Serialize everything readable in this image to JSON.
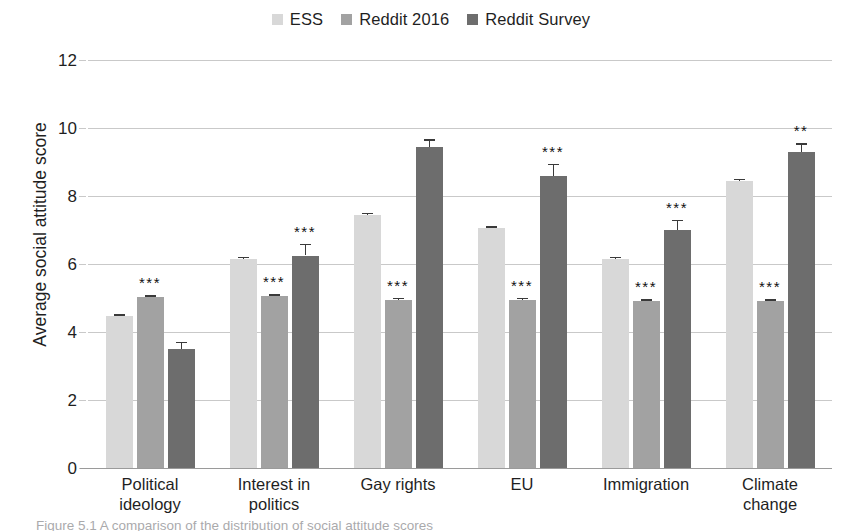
{
  "legend": {
    "entries": [
      {
        "label": "ESS",
        "color": "#d8d8d8",
        "icon": "square-swatch"
      },
      {
        "label": "Reddit 2016",
        "color": "#a2a2a2",
        "icon": "square-swatch"
      },
      {
        "label": "Reddit Survey",
        "color": "#6d6d6d",
        "icon": "square-swatch"
      }
    ]
  },
  "axis": {
    "y_title": "Average social attitude score",
    "y_ticks": [
      "0",
      "2",
      "4",
      "6",
      "8",
      "10",
      "12"
    ]
  },
  "caption": {
    "text": "Figure 5.1  A comparison of the distribution of social attitude scores"
  },
  "chart_data": {
    "type": "bar",
    "title": "",
    "xlabel": "",
    "ylabel": "Average social attitude score",
    "ylim": [
      0,
      12
    ],
    "ytick_step": 2,
    "grid": true,
    "legend_position": "top-center",
    "categories": [
      "Political ideology",
      "Interest in politics",
      "Gay rights",
      "EU",
      "Immigration",
      "Climate change"
    ],
    "series": [
      {
        "name": "ESS",
        "color": "#d8d8d8",
        "values": [
          4.47,
          6.15,
          7.45,
          7.05,
          6.15,
          8.45
        ],
        "errors": [
          0.06,
          0.06,
          0.06,
          0.06,
          0.06,
          0.06
        ],
        "significance": [
          "",
          "",
          "",
          "",
          "",
          ""
        ]
      },
      {
        "name": "Reddit 2016",
        "color": "#a2a2a2",
        "values": [
          5.02,
          5.05,
          4.95,
          4.95,
          4.9,
          4.9
        ],
        "errors": [
          0.05,
          0.06,
          0.05,
          0.05,
          0.05,
          0.05
        ],
        "significance": [
          "***",
          "***",
          "***",
          "***",
          "***",
          "***"
        ]
      },
      {
        "name": "Reddit Survey",
        "color": "#6d6d6d",
        "values": [
          3.5,
          6.25,
          9.45,
          8.6,
          7.0,
          9.3
        ],
        "errors": [
          0.22,
          0.35,
          0.22,
          0.35,
          0.3,
          0.25
        ],
        "significance": [
          "",
          "***",
          "",
          "***",
          "***",
          "**"
        ]
      }
    ]
  }
}
